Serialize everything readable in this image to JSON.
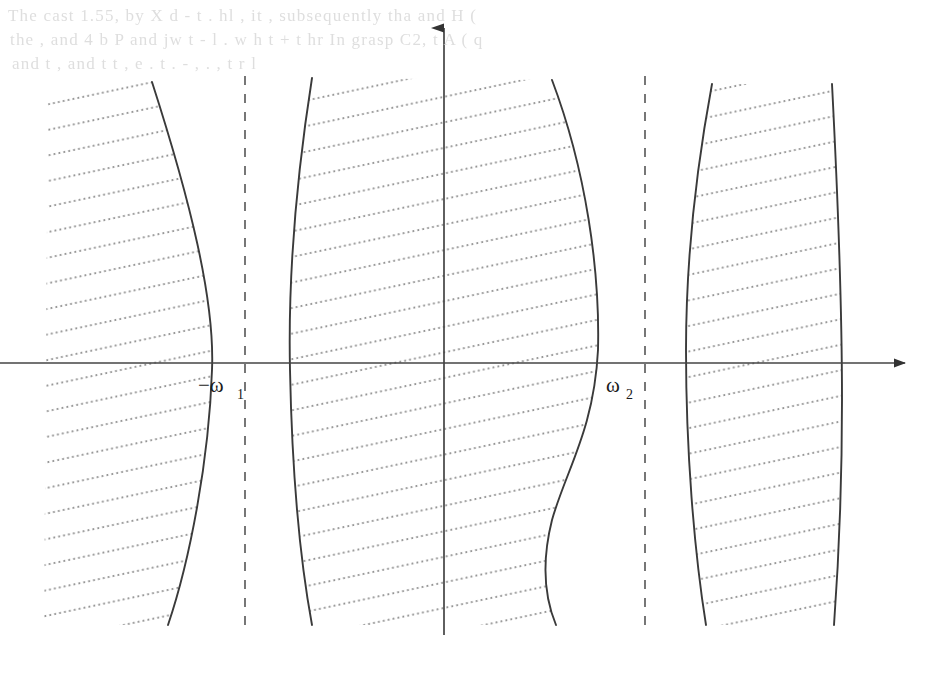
{
  "figure": {
    "kind": "math-diagram",
    "background_color": "#ffffff",
    "ink_color": "#3a3a3a",
    "axis_color": "#444444",
    "hatch_color": "#8a8a8a",
    "ghost_color": "#d9d9d9",
    "page_width": 942,
    "page_height": 674
  },
  "ghost_lines": [
    {
      "text": "The cast 1.55, by X  d - t  .  hl  , it  ,  subsequently  tha  and  H ( ",
      "x": 8,
      "y": 6
    },
    {
      "text": "the  ,  and  4  b   P  and  jw    t -  l     .  w  h    t + t   hr   In  grasp  C2,  t   A ( q ",
      "x": 10,
      "y": 30
    },
    {
      "text": "and  t  ,  and  t    t  ,  e  .   t  .  -  , .    ,  t  r     l",
      "x": 12,
      "y": 54
    }
  ],
  "axes": {
    "horizontal": {
      "name": "x-axis",
      "x1": 0,
      "y1": 363,
      "x2": 905,
      "y2": 363,
      "arrow": "right"
    },
    "vertical": {
      "name": "y-axis",
      "x1": 444,
      "y1": 635,
      "x2": 444,
      "y2": 28,
      "arrow": "up"
    }
  },
  "dashed_lines": [
    {
      "name": "dashed-line-left",
      "x": 245,
      "y_top": 76,
      "y_bottom": 625
    },
    {
      "name": "dashed-line-right",
      "x": 645,
      "y_top": 76,
      "y_bottom": 625
    }
  ],
  "labels": [
    {
      "name": "label-minus-omega-1",
      "text": "−ω",
      "subscript": "1",
      "x": 198,
      "y": 392,
      "sub_x": 237,
      "sub_y": 399
    },
    {
      "name": "label-omega-2",
      "text": "ω",
      "subscript": "2",
      "x": 606,
      "y": 392,
      "sub_x": 626,
      "sub_y": 399
    }
  ],
  "hatched_regions": [
    {
      "name": "hatched-region-1",
      "description": "leftmost band, clipped at left page edge, right boundary bulges rightward",
      "left_path": "M 48,84 L 44,625",
      "right_path": "M 152,82 C 190,200 215,300 212,370 C 209,460 190,560 168,625",
      "left_open": true
    },
    {
      "name": "hatched-region-2",
      "description": "second band, left boundary bows left, right boundary bulges right then returns",
      "left_path": "M 312,78 C 296,180 288,280 290,370 C 292,470 300,560 312,625",
      "right_path": "M 552,80 C 586,170 600,270 598,350 C 594,430 566,470 552,520 C 542,560 544,596 556,625",
      "left_open": false
    },
    {
      "name": "hatched-region-3",
      "description": "third band, narrow top-left, widening band at right of origin",
      "left_path": "M 712,84 C 696,170 686,260 686,350 C 686,450 694,550 706,625",
      "right_path": "M 832,84 C 838,200 842,320 842,400 C 842,500 838,570 834,625",
      "left_open": false
    }
  ],
  "hatching": {
    "style": "dotted",
    "angle_deg": -12,
    "spacing_px": 25,
    "dot_radius": 1.1,
    "dot_pitch": 5
  }
}
